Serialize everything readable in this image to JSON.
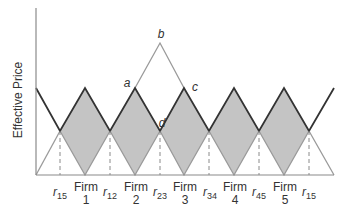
{
  "diagram": {
    "y_axis_label": "Effective Price",
    "point_labels": {
      "a": "a",
      "b": "b",
      "c": "c",
      "d": "d"
    },
    "firms": [
      {
        "label_top": "Firm",
        "label_bottom": "1"
      },
      {
        "label_top": "Firm",
        "label_bottom": "2"
      },
      {
        "label_top": "Firm",
        "label_bottom": "3"
      },
      {
        "label_top": "Firm",
        "label_bottom": "4"
      },
      {
        "label_top": "Firm",
        "label_bottom": "5"
      }
    ],
    "boundaries": [
      {
        "base": "r",
        "sub": "15"
      },
      {
        "base": "r",
        "sub": "12"
      },
      {
        "base": "r",
        "sub": "23"
      },
      {
        "base": "r",
        "sub": "34"
      },
      {
        "base": "r",
        "sub": "45"
      },
      {
        "base": "r",
        "sub": "15"
      }
    ],
    "colors": {
      "dark_line": "#333333",
      "light_line": "#9a9a9a",
      "fill": "#c4c4c4",
      "axis": "#8a8a8a",
      "dashed": "#8a8a8a",
      "text": "#333333"
    }
  }
}
